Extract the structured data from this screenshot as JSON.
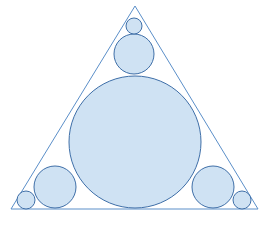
{
  "canvas": {
    "width": 266,
    "height": 225,
    "background": "#ffffff"
  },
  "figure": {
    "title": "Circle packing inside an equilateral triangle",
    "stroke_color": "#5b8fc9",
    "stroke_color_dark": "#3f6fa8",
    "fill_color": "#cfe2f3",
    "fill_opacity": 1,
    "stroke_width": 1
  },
  "triangle": {
    "name": "equilateral-triangle",
    "vertices": [
      {
        "label": "apex",
        "x": 135,
        "y": 6
      },
      {
        "label": "bottom-left",
        "x": 11,
        "y": 209
      },
      {
        "label": "bottom-right",
        "x": 258,
        "y": 209
      }
    ],
    "points_attr": "135,6 11,209 258,209"
  },
  "circles": [
    {
      "name": "incircle",
      "role": "central-incircle",
      "cx": 135,
      "cy": 142,
      "r": 66
    },
    {
      "name": "medium-circle-top",
      "role": "tangent-to-incircle-and-two-sides",
      "cx": 134,
      "cy": 54,
      "r": 20
    },
    {
      "name": "medium-circle-bottom-left",
      "role": "tangent-to-incircle-and-two-sides",
      "cx": 55,
      "cy": 187,
      "r": 21
    },
    {
      "name": "medium-circle-bottom-right",
      "role": "tangent-to-incircle-and-two-sides",
      "cx": 213,
      "cy": 187,
      "r": 21
    },
    {
      "name": "small-circle-apex",
      "role": "corner-circle",
      "cx": 134,
      "cy": 26,
      "r": 8
    },
    {
      "name": "small-circle-bottom-left",
      "role": "corner-circle",
      "cx": 26,
      "cy": 200,
      "r": 9
    },
    {
      "name": "small-circle-bottom-right",
      "role": "corner-circle",
      "cx": 242,
      "cy": 200,
      "r": 9
    }
  ],
  "chart_data": {
    "type": "diagram",
    "title": "Circle packing inside an equilateral triangle",
    "shape_count": 8,
    "circle_count": 7,
    "triangle_count": 1
  }
}
